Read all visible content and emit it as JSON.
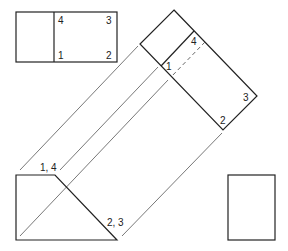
{
  "colors": {
    "stroke": "#222222",
    "projection": "#555555",
    "background": "#ffffff"
  },
  "views": {
    "top_view": {
      "labels": [
        "4",
        "3",
        "1",
        "2"
      ]
    },
    "auxiliary_view": {
      "labels": [
        "4",
        "1",
        "3",
        "2"
      ]
    },
    "front_view": {
      "labels": [
        "1, 4",
        "2, 3"
      ]
    },
    "side_view": {
      "labels": []
    }
  }
}
